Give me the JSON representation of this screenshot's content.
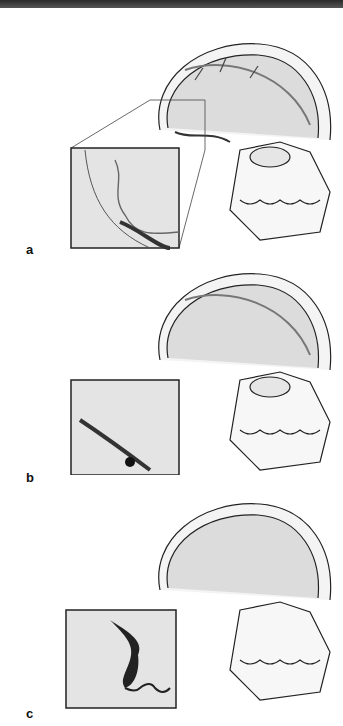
{
  "figure": {
    "panels": [
      {
        "label": "a",
        "stage": "normal venous anatomy"
      },
      {
        "label": "b",
        "stage": "focal thrombus in transverse sinus"
      },
      {
        "label": "c",
        "stage": "extensive thrombosis of cortical vein"
      }
    ],
    "colors": {
      "line": "#222222",
      "brain": "#d9d9d9",
      "vein": "#3a3a3a",
      "thrombus": "#111111"
    }
  }
}
